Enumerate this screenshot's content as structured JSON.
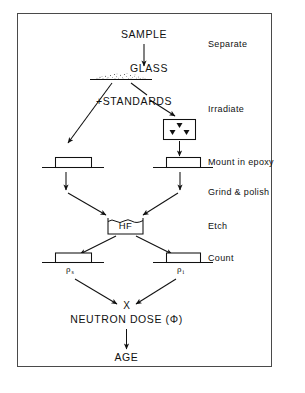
{
  "diagram": {
    "frame": {
      "border_color": "#4a4a4a",
      "background": "#ffffff"
    },
    "flow_labels": {
      "sample": "SAMPLE",
      "glass": "GLASS",
      "standards": "+STANDARDS",
      "hf": "HF",
      "rho_s": "ρ",
      "rho_s_sub": "s",
      "rho_i": "ρ",
      "rho_i_sub": "i",
      "multiply": "X",
      "neutron_dose": "NEUTRON DOSE (Φ)",
      "age": "AGE"
    },
    "step_labels": [
      {
        "id": "separate",
        "text": "Separate"
      },
      {
        "id": "irradiate",
        "text": "Irradiate"
      },
      {
        "id": "mount-in-epoxy",
        "text": "Mount in epoxy"
      },
      {
        "id": "grind-and-polish",
        "text": "Grind & polish"
      },
      {
        "id": "etch",
        "text": "Etch"
      },
      {
        "id": "count",
        "text": "Count"
      }
    ],
    "icons": {
      "neutron_source": "neutron-triangles-icon",
      "glass_mound": "stippled-glass-icon",
      "epoxy_mount": "epoxy-mount-icon",
      "hf_beaker": "hf-beaker-icon"
    },
    "colors": {
      "stroke": "#111111",
      "frame": "#4a4a4a",
      "background": "#ffffff"
    }
  }
}
